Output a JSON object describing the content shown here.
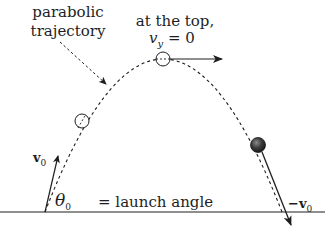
{
  "diagram": {
    "labels": {
      "trajectory_line1": "parabolic",
      "trajectory_line2": "trajectory",
      "top_line1": "at the top,",
      "vy_symbol": "v",
      "vy_subscript": "y",
      "vy_value": " = 0",
      "v0_symbol": "v",
      "v0_subscript": "0",
      "theta_symbol": "θ",
      "theta_subscript": "0",
      "launch_angle": "= launch angle",
      "neg_v0_prefix": "−v",
      "neg_v0_subscript": "0"
    },
    "elements": {
      "ground_line": {
        "y": 212,
        "x_start": 0,
        "x_end": 325
      },
      "launch_point": {
        "x": 45,
        "y": 212
      },
      "top_point": {
        "x": 163,
        "y": 59
      },
      "mid_ascent_point": {
        "x": 82,
        "y": 121
      },
      "descent_ball": {
        "x": 258,
        "y": 145
      },
      "landing_point": {
        "x": 282,
        "y": 212
      }
    },
    "colors": {
      "line": "#1e1e1e",
      "ball_dark": "#2a2a2a",
      "background": "#ffffff"
    }
  }
}
